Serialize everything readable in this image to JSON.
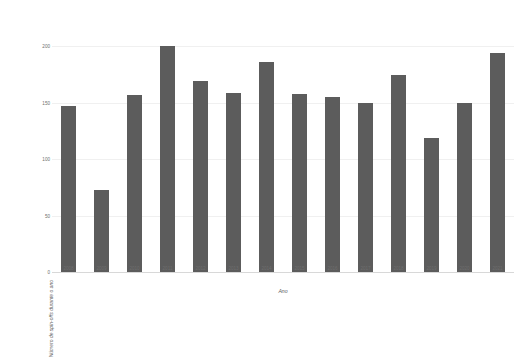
{
  "chart_data": {
    "type": "bar",
    "title": "",
    "subtitle": "",
    "xlabel": "Ano",
    "ylabel": "Número de spin-offs durante o ano",
    "categories": [
      "2008",
      "2009",
      "2010",
      "2011",
      "2012",
      "2013",
      "2014",
      "2015",
      "2016",
      "2017",
      "2018",
      "2019",
      "2020",
      "2021"
    ],
    "values": [
      147,
      73,
      157,
      200,
      169,
      159,
      186,
      158,
      155,
      150,
      175,
      119,
      150,
      194
    ],
    "series": [
      {
        "name": "Número de spin-offs durante o ano",
        "values": [
          147,
          73,
          157,
          200,
          169,
          159,
          186,
          158,
          155,
          150,
          175,
          119,
          150,
          194
        ]
      }
    ],
    "ylim": [
      0,
      250
    ],
    "yticks": [
      0,
      50,
      100,
      150,
      200,
      250
    ],
    "ytick_labels": [
      "0",
      "50",
      "100",
      "150",
      "200",
      "250"
    ],
    "xlim_categories": 14,
    "grid": true,
    "grid_axis": "y",
    "legend": false,
    "legend_position": "none",
    "bar_color": "#5c5c5c",
    "background_color": "#ffffff",
    "gridline_color": "#f0f0f0",
    "axis_text_color": "#6e6e6e"
  }
}
